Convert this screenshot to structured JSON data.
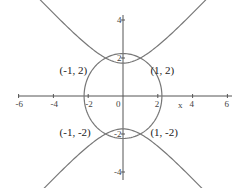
{
  "chart_data": {
    "type": "line",
    "title": "",
    "xlabel": "x",
    "ylabel": "",
    "xlim": [
      -6,
      6
    ],
    "ylim": [
      -4.5,
      4.5
    ],
    "grid": false,
    "x_ticks": [
      "-6",
      "-4",
      "-2",
      "0",
      "2",
      "4",
      "6"
    ],
    "y_ticks": [
      "4",
      "2",
      "-2",
      "-4"
    ],
    "series": [
      {
        "name": "circle",
        "equation": "x^2 + y^2 = 5"
      },
      {
        "name": "hyperbola",
        "equation": "y^2 - x^2 = 3"
      }
    ],
    "annotations": [
      {
        "text": "(-1, 2)",
        "x": -1,
        "y": 2
      },
      {
        "text": "(1, 2)",
        "x": 1,
        "y": 2
      },
      {
        "text": "(-1, -2)",
        "x": -1,
        "y": -2
      },
      {
        "text": "(1, -2)",
        "x": 1,
        "y": -2
      }
    ]
  },
  "colors": {
    "curve": "#777777",
    "axis": "#555555"
  }
}
